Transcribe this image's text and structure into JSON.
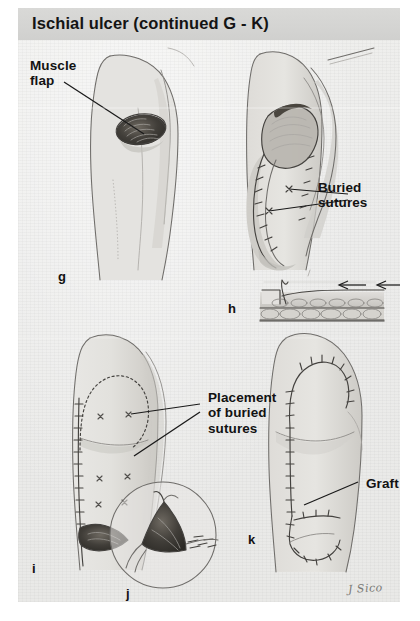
{
  "figure": {
    "title": "Ischial ulcer (continued G - K)",
    "signature": "J Sico",
    "background_color": "#ececea",
    "title_band_color": "#d4d4d2",
    "text_color": "#121212"
  },
  "annotations": [
    {
      "id": "muscle-flap",
      "text": "Muscle\nflap",
      "x": 12,
      "y": 50
    },
    {
      "id": "buried-sutures",
      "text": "Buried\nsutures",
      "x": 300,
      "y": 172
    },
    {
      "id": "placement-of-buried-sutures",
      "text": "Placement\nof buried\nsutures",
      "x": 190,
      "y": 382
    },
    {
      "id": "graft",
      "text": "Graft",
      "x": 348,
      "y": 468
    }
  ],
  "panels": [
    {
      "letter": "g",
      "x": 40,
      "y": 268,
      "caption": "Muscle flap rotated into ischial ulcer defect"
    },
    {
      "letter": "h",
      "x": 228,
      "y": 300,
      "caption": "Cross-section of tissue layers with advancement arrows"
    },
    {
      "letter": "i",
      "x": 32,
      "y": 562,
      "caption": "Flap outline with placement of buried sutures marked"
    },
    {
      "letter": "j",
      "x": 126,
      "y": 588,
      "caption": "Circular inset detail of wound closure"
    },
    {
      "letter": "k",
      "x": 248,
      "y": 533,
      "caption": "Completed closure with skin graft"
    }
  ]
}
